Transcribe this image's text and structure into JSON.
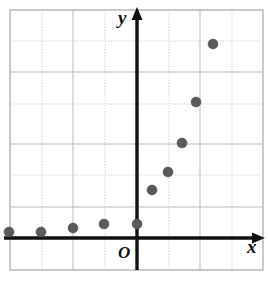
{
  "chart_data": {
    "type": "scatter",
    "title": "",
    "xlabel": "x",
    "ylabel": "y",
    "grid": true,
    "legend": null,
    "axis_origin_label": "O",
    "xlim": [
      -4,
      4
    ],
    "ylim": [
      -1,
      7
    ],
    "gridline_step": 1,
    "point_color": "#5a5a5a",
    "point_radius": 5,
    "points": [
      {
        "x": -4.0,
        "y": 0.18
      },
      {
        "x": -3.0,
        "y": 0.32
      },
      {
        "x": -2.0,
        "y": 0.45
      },
      {
        "x": -1.0,
        "y": 0.45
      },
      {
        "x": 0.0,
        "y": 0.45
      },
      {
        "x": 0.5,
        "y": 1.5
      },
      {
        "x": 1.0,
        "y": 2.1
      },
      {
        "x": 1.4,
        "y": 3.0
      },
      {
        "x": 1.85,
        "y": 4.3
      },
      {
        "x": 2.4,
        "y": 6.1
      }
    ],
    "pixel_points": [
      {
        "px": 9,
        "py": 232
      },
      {
        "px": 41,
        "py": 232
      },
      {
        "px": 73,
        "py": 228
      },
      {
        "px": 104,
        "py": 224
      },
      {
        "px": 137,
        "py": 224
      },
      {
        "px": 152,
        "py": 190
      },
      {
        "px": 168,
        "py": 172
      },
      {
        "px": 182,
        "py": 143
      },
      {
        "px": 196,
        "py": 102
      },
      {
        "px": 213,
        "py": 44
      }
    ],
    "geometry": {
      "grid_left": 10,
      "grid_right": 263,
      "grid_top": 10,
      "grid_bottom": 270,
      "x_axis_y": 238,
      "y_axis_x": 137,
      "cell_w": 31.6,
      "vertical_gridlines": [
        10,
        42,
        73,
        105,
        137,
        169,
        200,
        232,
        263
      ],
      "horizontal_gridlines": [
        10,
        41,
        72,
        104,
        144,
        175,
        207,
        238,
        270
      ]
    },
    "colors": {
      "gridline": "#b9b9b9",
      "gridline_dotted": "#c9c9c9",
      "axis": "#111111",
      "border": "#bdbdbd",
      "background": "#ffffff"
    }
  },
  "figure": {
    "caption": "",
    "x_axis_label": "x",
    "y_axis_label": "y",
    "origin_label": "O"
  }
}
